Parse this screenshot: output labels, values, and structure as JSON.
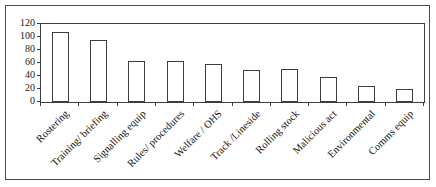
{
  "chart_data": {
    "type": "bar",
    "title": "",
    "xlabel": "",
    "ylabel": "",
    "categories": [
      "Rostering",
      "Training/ briefing",
      "Signalling equip",
      "Rules/ procedures",
      "Welfare / OHS",
      "Track /Lineside",
      "Rolling stock",
      "Malicious act",
      "Environmental",
      "Comms equip"
    ],
    "values": [
      108,
      95,
      63,
      63,
      58,
      49,
      50,
      38,
      24,
      20
    ],
    "ylim": [
      0,
      120
    ],
    "yticks": [
      0,
      20,
      40,
      60,
      80,
      100,
      120
    ],
    "grid": false,
    "legend": null,
    "x_label_rotation_deg": 45,
    "bar_fill": "#ffffff",
    "bar_border": "#3d3d3d",
    "frame_border": "#4a4a4a",
    "background": "#ffffff"
  }
}
